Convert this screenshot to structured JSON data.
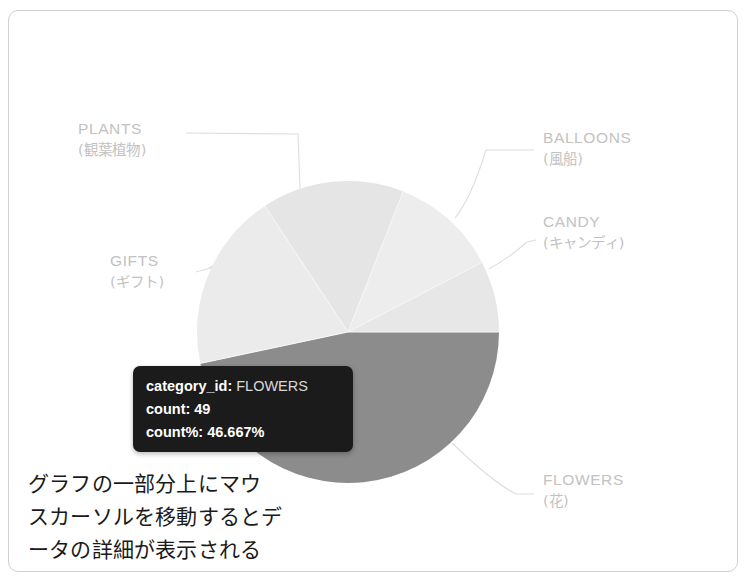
{
  "chart_data": {
    "type": "pie",
    "title": "",
    "categories": [
      "FLOWERS",
      "PLANTS",
      "GIFTS",
      "BALLOONS",
      "CANDY"
    ],
    "values": [
      49,
      20,
      16,
      12,
      8
    ],
    "labels_en": [
      "FLOWERS",
      "PLANTS",
      "GIFTS",
      "BALLOONS",
      "CANDY"
    ],
    "labels_ja": [
      "(花)",
      "(観葉植物)",
      "(ギフト)",
      "(風船)",
      "(キャンディ)"
    ],
    "legend": "outside-labels-with-leader-lines",
    "highlighted_slice": "FLOWERS",
    "highlight_percent": "46.667%",
    "highlight_count": 49,
    "grid": false,
    "slices": [
      {
        "id": "flowers",
        "label_en": "FLOWERS",
        "label_ja": "(花)",
        "count": 49,
        "percent": 46.667,
        "start_deg": 0,
        "sweep_deg": 168.0,
        "color": "#8c8c8c"
      },
      {
        "id": "plants",
        "label_en": "PLANTS",
        "label_ja": "(観葉植物)",
        "count": 20,
        "percent": 19.05,
        "start_deg": 168.0,
        "sweep_deg": 68.6,
        "color": "#ebebeb"
      },
      {
        "id": "gifts",
        "label_en": "GIFTS",
        "label_ja": "(ギフト)",
        "count": 16,
        "percent": 15.24,
        "start_deg": 236.6,
        "sweep_deg": 54.9,
        "color": "#e5e5e5"
      },
      {
        "id": "balloons",
        "label_en": "BALLOONS",
        "label_ja": "(風船)",
        "count": 12,
        "percent": 11.43,
        "start_deg": 291.5,
        "sweep_deg": 41.1,
        "color": "#ededed"
      },
      {
        "id": "candy",
        "label_en": "CANDY",
        "label_ja": "(キャンディ)",
        "count": 8,
        "percent": 7.62,
        "start_deg": 332.6,
        "sweep_deg": 27.4,
        "color": "#e7e7e7"
      }
    ]
  },
  "colors": {
    "highlight": "#8c8c8c",
    "slice_light": "#eaeaea",
    "label_text": "#c2c2c2",
    "tooltip_bg": "#1b1b1b",
    "tooltip_text": "#ffffff",
    "frame_border": "#d0d0d0",
    "leader_line": "#dedede"
  },
  "labels": {
    "plants": {
      "en": "PLANTS",
      "ja": "(観葉植物)"
    },
    "gifts": {
      "en": "GIFTS",
      "ja": "(ギフト)"
    },
    "balloons": {
      "en": "BALLOONS",
      "ja": "(風船)"
    },
    "candy": {
      "en": "CANDY",
      "ja": "(キャンディ)"
    },
    "flowers": {
      "en": "FLOWERS",
      "ja": "(花)"
    }
  },
  "tooltip": {
    "category_key": "category_id:",
    "category_value": "FLOWERS",
    "count_key": "count:",
    "count_value": "49",
    "percent_key": "count%:",
    "percent_value": "46.667%"
  },
  "caption": {
    "line1": "グラフの一部分上にマウ",
    "line2": "スカーソルを移動するとデ",
    "line3": "ータの詳細が表示される"
  }
}
